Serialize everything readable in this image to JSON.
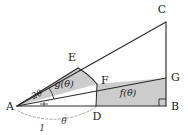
{
  "figure": {
    "background_color": "#ffffff",
    "stroke_color": "#2b2b2b",
    "shade_color": "#c9c9c9",
    "dashed_color": "#9a9a9a"
  },
  "points": {
    "A": {
      "label": "A",
      "x": 17,
      "y": 106,
      "label_x": 8,
      "label_y": 110
    },
    "B": {
      "label": "B",
      "x": 166,
      "y": 106,
      "label_x": 172,
      "label_y": 110
    },
    "C": {
      "label": "C",
      "x": 166,
      "y": 22,
      "label_x": 161,
      "label_y": 12
    },
    "D": {
      "label": "D",
      "x": 96,
      "y": 106,
      "label_x": 92,
      "label_y": 120
    },
    "E": {
      "label": "E",
      "x": 78,
      "y": 68,
      "label_x": 70,
      "label_y": 60
    },
    "F": {
      "label": "F",
      "x": 97,
      "y": 84,
      "label_x": 101,
      "label_y": 83
    },
    "G": {
      "label": "G",
      "x": 166,
      "y": 78,
      "label_x": 172,
      "label_y": 80
    }
  },
  "labels": {
    "f_region": "f(θ)",
    "g_region": "g(θ)",
    "angle_two_theta": "2θ",
    "angle_theta": "θ",
    "radius_one": "1"
  },
  "regions": [
    {
      "name": "f-region",
      "label": "f(θ)",
      "label_x": 128,
      "label_y": 95,
      "description": "shaded region bounded by D, F, G, B"
    },
    {
      "name": "g-region",
      "label": "g(θ)",
      "label_x": 62,
      "label_y": 86,
      "description": "shaded circular sector bounded by A, E, F"
    }
  ],
  "angles": [
    {
      "name": "angle-two-theta",
      "label": "2θ",
      "label_x": 38,
      "label_y": 96,
      "vertex": "A",
      "description": "angle EAD at vertex A measuring two theta"
    },
    {
      "name": "angle-theta",
      "label": "θ",
      "label_x": 58,
      "label_y": 124,
      "vertex": "A",
      "description": "angle theta marked on dashed arc below baseline"
    }
  ],
  "measures": [
    {
      "name": "unit-radius",
      "label": "1",
      "label_x": 40,
      "label_y": 131,
      "description": "unit length from A to D shown with dashed arc"
    }
  ],
  "markers": [
    {
      "name": "right-angle-at-B",
      "description": "right angle square marker at vertex B"
    },
    {
      "name": "right-angle-tick-at-A",
      "description": "small angle tick marker at vertex A on baseline"
    }
  ]
}
